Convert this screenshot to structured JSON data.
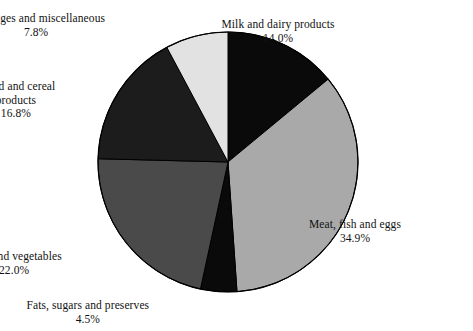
{
  "chart_data": {
    "type": "pie",
    "title": "",
    "subtitle": "",
    "xlabel": "",
    "ylabel": "",
    "legend_position": "none",
    "grid": false,
    "value_unit": "percent",
    "total": 100.0,
    "start_angle_deg": 0,
    "direction": "clockwise",
    "categories": [
      "Milk and dairy products",
      "Meat, fish and eggs",
      "Fats, sugars and preserves",
      "Fruit and vegetables",
      "Bread and cereal products",
      "Beverages and miscellaneous"
    ],
    "values": [
      14.0,
      34.9,
      4.5,
      22.0,
      16.8,
      7.8
    ],
    "slices": [
      {
        "name": "Milk and dairy products",
        "value": 14.0,
        "value_label": "14.0%",
        "color": "#0a0a0a",
        "start_deg": 0.0,
        "end_deg": 50.4
      },
      {
        "name": "Meat, fish and eggs",
        "value": 34.9,
        "value_label": "34.9%",
        "color": "#a9a9a9",
        "start_deg": 50.4,
        "end_deg": 176.04
      },
      {
        "name": "Fats, sugars and preserves",
        "value": 4.5,
        "value_label": "4.5%",
        "color": "#0a0a0a",
        "start_deg": 176.04,
        "end_deg": 192.24
      },
      {
        "name": "Fruit and vegetables",
        "value": 22.0,
        "value_label": "22.0%",
        "color": "#4a4a4a",
        "start_deg": 192.24,
        "end_deg": 271.44
      },
      {
        "name": "Bread and cereal products",
        "value": 16.8,
        "value_label": "16.8%",
        "color": "#1c1c1c",
        "start_deg": 271.44,
        "end_deg": 331.92
      },
      {
        "name": "Beverages and miscellaneous",
        "value": 7.8,
        "value_label": "7.8%",
        "color": "#e2e2e2",
        "start_deg": 331.92,
        "end_deg": 360.0
      }
    ]
  },
  "labels": {
    "beverages": {
      "line1": "Beverages and miscellaneous",
      "line2": "7.8%"
    },
    "milk": {
      "line1": "Milk and dairy products",
      "line2": "14.0%"
    },
    "bread": {
      "line1": "Bread and cereal",
      "line2": "products",
      "line3": "16.8%"
    },
    "meat": {
      "line1": "Meat, fish and eggs",
      "line2": "34.9%"
    },
    "fruit": {
      "line1": "Fruit and vegetables",
      "line2": "22.0%"
    },
    "fats": {
      "line1": "Fats, sugars and preserves",
      "line2": "4.5%"
    }
  },
  "geometry": {
    "center_x": 228,
    "center_y": 162,
    "radius": 130,
    "outline_color": "#000000"
  }
}
